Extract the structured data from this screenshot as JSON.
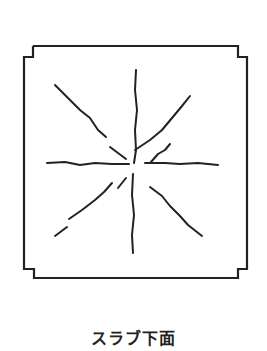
{
  "caption": "スラブ下面",
  "colors": {
    "background": "#ffffff",
    "line": "#222222"
  },
  "slab_outline": {
    "description": "square slab with notched corners (column positions)",
    "points": [
      [
        33,
        46
      ],
      [
        238,
        46
      ],
      [
        238,
        57
      ],
      [
        247,
        57
      ],
      [
        247,
        269
      ],
      [
        238,
        269
      ],
      [
        238,
        278
      ],
      [
        34,
        278
      ],
      [
        34,
        269
      ],
      [
        24,
        269
      ],
      [
        24,
        57
      ],
      [
        33,
        57
      ],
      [
        33,
        46
      ]
    ]
  },
  "cracks": [
    {
      "name": "crack-vertical-top",
      "points": [
        [
          136,
          70
        ],
        [
          135,
          90
        ],
        [
          137,
          110
        ],
        [
          135,
          130
        ],
        [
          136,
          150
        ],
        [
          134,
          163
        ]
      ]
    },
    {
      "name": "crack-vertical-bottom",
      "points": [
        [
          133,
          174
        ],
        [
          132,
          195
        ],
        [
          134,
          215
        ],
        [
          132,
          235
        ],
        [
          133,
          253
        ]
      ]
    },
    {
      "name": "crack-horizontal-left",
      "points": [
        [
          47,
          163
        ],
        [
          65,
          162
        ],
        [
          80,
          165
        ],
        [
          95,
          163
        ],
        [
          112,
          164
        ],
        [
          129,
          164
        ]
      ]
    },
    {
      "name": "crack-horizontal-right",
      "points": [
        [
          145,
          163
        ],
        [
          165,
          163
        ],
        [
          180,
          164
        ],
        [
          198,
          163
        ],
        [
          218,
          165
        ]
      ]
    },
    {
      "name": "crack-diagonal-upper-left-a",
      "points": [
        [
          55,
          85
        ],
        [
          70,
          100
        ],
        [
          80,
          110
        ],
        [
          90,
          118
        ],
        [
          98,
          130
        ],
        [
          106,
          137
        ]
      ]
    },
    {
      "name": "crack-diagonal-upper-left-b",
      "points": [
        [
          110,
          147
        ],
        [
          118,
          153
        ],
        [
          126,
          159
        ]
      ]
    },
    {
      "name": "crack-diagonal-upper-right",
      "points": [
        [
          135,
          150
        ],
        [
          150,
          140
        ],
        [
          162,
          130
        ],
        [
          172,
          118
        ],
        [
          182,
          106
        ],
        [
          190,
          96
        ]
      ]
    },
    {
      "name": "crack-branch-right",
      "points": [
        [
          151,
          162
        ],
        [
          158,
          154
        ],
        [
          165,
          150
        ],
        [
          170,
          144
        ]
      ]
    },
    {
      "name": "crack-diagonal-lower-left-a",
      "points": [
        [
          55,
          236
        ],
        [
          67,
          227
        ]
      ]
    },
    {
      "name": "crack-diagonal-lower-left-b",
      "points": [
        [
          69,
          219
        ],
        [
          82,
          210
        ],
        [
          95,
          200
        ],
        [
          104,
          192
        ],
        [
          112,
          183
        ]
      ]
    },
    {
      "name": "crack-diagonal-lower-left-c",
      "points": [
        [
          118,
          188
        ],
        [
          126,
          178
        ]
      ]
    },
    {
      "name": "crack-diagonal-lower-right",
      "points": [
        [
          150,
          187
        ],
        [
          162,
          196
        ],
        [
          170,
          206
        ],
        [
          180,
          216
        ],
        [
          188,
          225
        ],
        [
          202,
          236
        ]
      ]
    }
  ]
}
